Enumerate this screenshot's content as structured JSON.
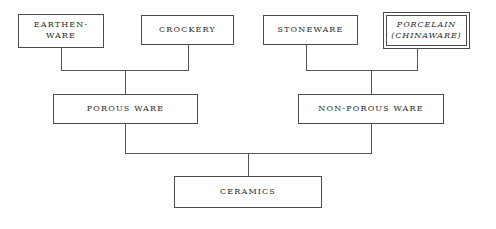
{
  "diagram": {
    "type": "hierarchy-tree",
    "orientation": "bottom-up",
    "background_color": "#ffffff",
    "line_color": "#55555a",
    "text_color": "#2b2b2b",
    "nodes": {
      "earthenware": {
        "label": "EARTHEN-\nWARE"
      },
      "crockery": {
        "label": "CROCKERY"
      },
      "stoneware": {
        "label": "STONEWARE"
      },
      "porcelain": {
        "label": "PORCELAIN\n(CHINAWARE)"
      },
      "porous_ware": {
        "label": "POROUS WARE"
      },
      "non_porous_ware": {
        "label": "NON-POROUS WARE"
      },
      "ceramics": {
        "label": "CERAMICS"
      }
    },
    "edges": [
      {
        "from": "earthenware",
        "to": "porous_ware"
      },
      {
        "from": "crockery",
        "to": "porous_ware"
      },
      {
        "from": "stoneware",
        "to": "non_porous_ware"
      },
      {
        "from": "porcelain",
        "to": "non_porous_ware"
      },
      {
        "from": "porous_ware",
        "to": "ceramics"
      },
      {
        "from": "non_porous_ware",
        "to": "ceramics"
      }
    ]
  }
}
